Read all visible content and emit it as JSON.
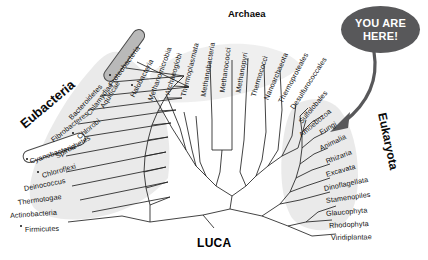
{
  "figure": {
    "root_label": "LUCA",
    "callout": {
      "line1": "YOU ARE",
      "line2": "HERE!",
      "points_to": "Animalia"
    },
    "colors": {
      "background": "#ffffff",
      "branch": "#222222",
      "domain_shade": "#e9e9e9",
      "callout_fill": "#58585a",
      "callout_text": "#ffffff",
      "highlight_fill": "#b9b9b9",
      "highlight_stroke": "#4a4a4a"
    }
  },
  "domains": [
    {
      "key": "eubacteria",
      "label": "Eubacteria"
    },
    {
      "key": "archaea",
      "label": "Archaea"
    },
    {
      "key": "eukaryota",
      "label": "Eukaryota"
    }
  ],
  "taxa": {
    "eubacteria": [
      {
        "label": "Proteobacteria",
        "dot": true,
        "highlight": "filled"
      },
      {
        "label": "Aquificae",
        "dot": false,
        "highlight": "none"
      },
      {
        "label": "Chlamydiae",
        "dot": false,
        "highlight": "none"
      },
      {
        "label": "Bacteroidetes",
        "dot": false,
        "highlight": "none"
      },
      {
        "label": "Chlorobi",
        "dot": true,
        "highlight": "none"
      },
      {
        "label": "Fibrobacteres",
        "dot": false,
        "highlight": "none"
      },
      {
        "label": "Spirochetes",
        "dot": false,
        "highlight": "none"
      },
      {
        "label": "Cyanobacteria",
        "dot": true,
        "highlight": "outlined"
      },
      {
        "label": "Chloroflexi",
        "dot": true,
        "highlight": "none"
      },
      {
        "label": "Deinococcus",
        "dot": false,
        "highlight": "none"
      },
      {
        "label": "Thermotogae",
        "dot": false,
        "highlight": "none"
      },
      {
        "label": "Actinobacteria",
        "dot": false,
        "highlight": "none"
      },
      {
        "label": "Firmicutes",
        "dot": true,
        "highlight": "none"
      }
    ],
    "archaea": [
      {
        "label": "Halobacteria",
        "dot": true
      },
      {
        "label": "Methanomicrobia",
        "dot": false
      },
      {
        "label": "Archaeoglobi",
        "dot": false
      },
      {
        "label": "Thermoplasmata",
        "dot": false
      },
      {
        "label": "Methanobacteria",
        "dot": false
      },
      {
        "label": "Methanococci",
        "dot": false
      },
      {
        "label": "Methanopyri",
        "dot": false
      },
      {
        "label": "Thermococci",
        "dot": false
      },
      {
        "label": "Nanoarchaeota",
        "dot": false
      },
      {
        "label": "Thermoproteales",
        "dot": false
      },
      {
        "label": "Desulfurococcales",
        "dot": false
      },
      {
        "label": "Sulfolobales",
        "dot": false
      }
    ],
    "eukaryota": [
      {
        "label": "Amoebozoa",
        "dot": false
      },
      {
        "label": "Fungi",
        "dot": false
      },
      {
        "label": "Animalia",
        "dot": false
      },
      {
        "label": "Rhizaria",
        "dot": false
      },
      {
        "label": "Excavata",
        "dot": false
      },
      {
        "label": "Dinoflagellata",
        "dot": false
      },
      {
        "label": "Stamenopiles",
        "dot": false
      },
      {
        "label": "Glaucophyta",
        "dot": false
      },
      {
        "label": "Rhodophyta",
        "dot": false
      },
      {
        "label": "Viridiplantae",
        "dot": false
      }
    ]
  }
}
